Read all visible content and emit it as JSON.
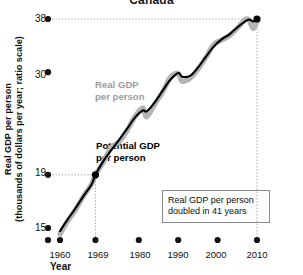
{
  "chart_data": {
    "type": "line",
    "title": "Canada",
    "xlabel": "Year",
    "ylabel": "Real GDP per person (thousands of dollars per year; ratio scale)",
    "ylabel_line1": "Real GDP per person",
    "ylabel_line2": "(thousands of dollars per year; ratio scale)",
    "scale": "ratio (logarithmic)",
    "grid": false,
    "legend": "inline labels",
    "xlim": [
      1960,
      2010
    ],
    "ylim": [
      14,
      39
    ],
    "ytick_labels": [
      "38",
      "30",
      "19",
      "15"
    ],
    "ytick_values": [
      38,
      30,
      19,
      15
    ],
    "xtick_labels": [
      "1960",
      "1969",
      "1980",
      "1990",
      "2000",
      "2010"
    ],
    "xtick_values": [
      1960,
      1969,
      1980,
      1990,
      2000,
      2010
    ],
    "annotation": "Real GDP per person doubled in 41 years",
    "annotation_line1": "Real GDP per person",
    "annotation_line2": "doubled in 41 years",
    "reference_lines": [
      {
        "type": "horizontal",
        "value": 38,
        "label": "38"
      },
      {
        "type": "horizontal",
        "value": 19,
        "label": "19"
      },
      {
        "type": "vertical",
        "value": 1969,
        "label": "1969"
      },
      {
        "type": "vertical",
        "value": 2010,
        "label": "2010"
      }
    ],
    "highlight_points": [
      {
        "x": 1969,
        "y": 19
      },
      {
        "x": 2010,
        "y": 38
      }
    ],
    "series": [
      {
        "name": "Real GDP per person",
        "label_line1": "Real GDP",
        "label_line2": "per person",
        "color": "#b4b4b4",
        "x": [
          1960,
          1962,
          1964,
          1966,
          1968,
          1969,
          1971,
          1973,
          1975,
          1977,
          1979,
          1981,
          1982,
          1984,
          1986,
          1988,
          1990,
          1991,
          1993,
          1995,
          1997,
          1999,
          2001,
          2003,
          2005,
          2007,
          2008,
          2009,
          2010
        ],
        "values": [
          14.6,
          15.5,
          16.3,
          17.3,
          18.2,
          19.0,
          20.1,
          21.5,
          22.0,
          23.1,
          24.6,
          25.6,
          24.6,
          26.0,
          27.4,
          29.3,
          29.8,
          28.8,
          29.2,
          30.4,
          32.0,
          33.9,
          34.6,
          35.3,
          36.5,
          37.9,
          37.8,
          36.4,
          37.6
        ]
      },
      {
        "name": "Potential GDP per person",
        "label_line1": "Potential GDP",
        "label_line2": "per person",
        "color": "#000000",
        "x": [
          1960,
          1962,
          1964,
          1966,
          1968,
          1969,
          1971,
          1973,
          1975,
          1977,
          1979,
          1981,
          1982,
          1984,
          1986,
          1988,
          1990,
          1991,
          1993,
          1995,
          1997,
          1999,
          2001,
          2003,
          2005,
          2007,
          2008,
          2009,
          2010
        ],
        "values": [
          14.8,
          15.6,
          16.4,
          17.3,
          18.2,
          19.0,
          20.2,
          21.2,
          22.2,
          23.3,
          24.5,
          25.3,
          25.2,
          26.2,
          27.6,
          29.0,
          29.9,
          29.4,
          29.5,
          30.6,
          32.1,
          33.6,
          34.7,
          35.5,
          36.6,
          37.6,
          37.9,
          37.6,
          37.9
        ]
      }
    ]
  }
}
